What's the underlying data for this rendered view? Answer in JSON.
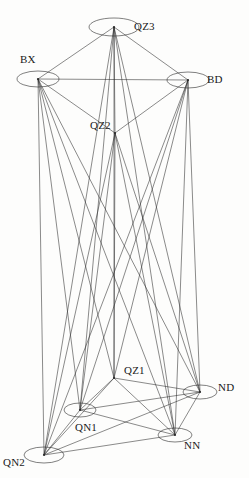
{
  "figure": {
    "type": "network-graph",
    "title": "",
    "background_color": "#fdfdfc",
    "line_color": "#2b2b2b",
    "width": 249,
    "height": 478
  },
  "nodes": [
    {
      "id": "QZ3",
      "label": "QZ3",
      "x": 114,
      "y": 27,
      "shape": "ellipse",
      "rx": 25,
      "ry": 9,
      "label_x": 134,
      "label_y": 21
    },
    {
      "id": "BX",
      "label": "BX",
      "x": 38,
      "y": 79,
      "shape": "ellipse",
      "rx": 21,
      "ry": 8,
      "label_x": 20,
      "label_y": 54
    },
    {
      "id": "BD",
      "label": "BD",
      "x": 188,
      "y": 80,
      "shape": "ellipse",
      "rx": 21,
      "ry": 8,
      "label_x": 207,
      "label_y": 74
    },
    {
      "id": "QZ2",
      "label": "QZ2",
      "x": 115,
      "y": 133,
      "shape": "point",
      "rx": 0,
      "ry": 0,
      "label_x": 90,
      "label_y": 120
    },
    {
      "id": "QZ1",
      "label": "QZ1",
      "x": 114,
      "y": 378,
      "shape": "point",
      "rx": 0,
      "ry": 0,
      "label_x": 124,
      "label_y": 365
    },
    {
      "id": "ND",
      "label": "ND",
      "x": 200,
      "y": 392,
      "shape": "ellipse",
      "rx": 17,
      "ry": 7,
      "label_x": 218,
      "label_y": 382
    },
    {
      "id": "QN1",
      "label": "QN1",
      "x": 80,
      "y": 410,
      "shape": "ellipse",
      "rx": 16,
      "ry": 7,
      "label_x": 75,
      "label_y": 422
    },
    {
      "id": "NN",
      "label": "NN",
      "x": 175,
      "y": 435,
      "shape": "ellipse",
      "rx": 17,
      "ry": 7,
      "label_x": 184,
      "label_y": 440
    },
    {
      "id": "QN2",
      "label": "QN2",
      "x": 44,
      "y": 455,
      "shape": "ellipse",
      "rx": 20,
      "ry": 8,
      "label_x": 3,
      "label_y": 457
    }
  ],
  "edges": [
    [
      "QZ3",
      "BX"
    ],
    [
      "QZ3",
      "BD"
    ],
    [
      "BX",
      "BD"
    ],
    [
      "BX",
      "QZ2"
    ],
    [
      "BD",
      "QZ2"
    ],
    [
      "QZ3",
      "QZ2"
    ],
    [
      "QZ3",
      "QN1"
    ],
    [
      "QZ3",
      "QN2"
    ],
    [
      "QZ3",
      "QZ1"
    ],
    [
      "QZ3",
      "NN"
    ],
    [
      "QZ3",
      "ND"
    ],
    [
      "BX",
      "QN1"
    ],
    [
      "BX",
      "QN2"
    ],
    [
      "BX",
      "QZ1"
    ],
    [
      "BX",
      "NN"
    ],
    [
      "BX",
      "ND"
    ],
    [
      "BD",
      "QN1"
    ],
    [
      "BD",
      "QN2"
    ],
    [
      "BD",
      "QZ1"
    ],
    [
      "BD",
      "NN"
    ],
    [
      "BD",
      "ND"
    ],
    [
      "QZ2",
      "QN1"
    ],
    [
      "QZ2",
      "QN2"
    ],
    [
      "QZ2",
      "QZ1"
    ],
    [
      "QZ2",
      "NN"
    ],
    [
      "QZ2",
      "ND"
    ],
    [
      "QZ1",
      "QN1"
    ],
    [
      "QZ1",
      "QN2"
    ],
    [
      "QZ1",
      "NN"
    ],
    [
      "QZ1",
      "ND"
    ],
    [
      "QN1",
      "QN2"
    ],
    [
      "QN1",
      "NN"
    ],
    [
      "QN1",
      "ND"
    ],
    [
      "QN2",
      "NN"
    ],
    [
      "QN2",
      "ND"
    ],
    [
      "NN",
      "ND"
    ]
  ]
}
